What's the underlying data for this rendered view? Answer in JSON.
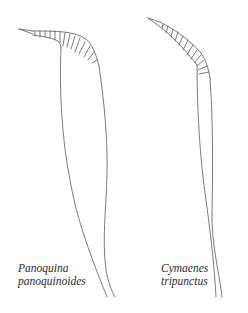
{
  "figure": {
    "type": "antenna-illustration",
    "stroke_color": "#555555",
    "specimens": [
      {
        "genus": "Panoquina",
        "species": "panoquinoides"
      },
      {
        "genus": "Cymaenes",
        "species": "tripunctus"
      }
    ]
  }
}
